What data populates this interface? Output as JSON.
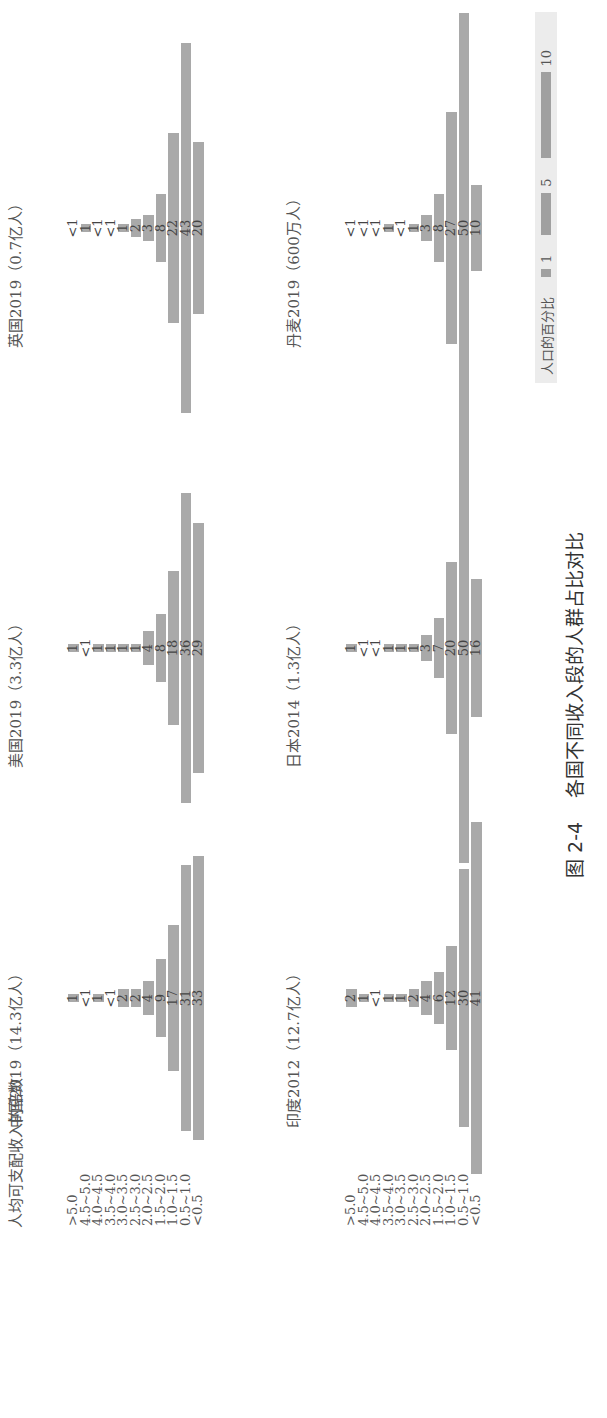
{
  "chart_data": {
    "type": "bar",
    "title": "图 2-4  各国不同收入段的人群占比对比",
    "ylabel": "人均可支配收入的倍数",
    "xlabel": "人口的百分比",
    "categories": [
      ">5.0",
      "4.5~5.0",
      "4.0~4.5",
      "3.5~4.0",
      "3.0~3.5",
      "2.5~3.0",
      "2.0~2.5",
      "1.5~2.0",
      "1.0~1.5",
      "0.5~1.0",
      "<0.5"
    ],
    "series": [
      {
        "name": "中国2019（14.3亿人）",
        "labels": [
          "1",
          "<1",
          "1",
          "<1",
          "2",
          "2",
          "4",
          "9",
          "17",
          "31",
          "33"
        ],
        "values": [
          1,
          0.5,
          1,
          0.5,
          2,
          2,
          4,
          9,
          17,
          31,
          33
        ]
      },
      {
        "name": "美国2019（3.3亿人）",
        "labels": [
          "1",
          "<1",
          "1",
          "1",
          "1",
          "1",
          "4",
          "8",
          "18",
          "36",
          "29"
        ],
        "values": [
          1,
          0.5,
          1,
          1,
          1,
          1,
          4,
          8,
          18,
          36,
          29
        ]
      },
      {
        "name": "英国2019（0.7亿人）",
        "labels": [
          "<1",
          "1",
          "<1",
          "<1",
          "1",
          "2",
          "3",
          "8",
          "22",
          "43",
          "20"
        ],
        "values": [
          0.5,
          1,
          0.5,
          0.5,
          1,
          2,
          3,
          8,
          22,
          43,
          20
        ]
      },
      {
        "name": "印度2012（12.7亿人）",
        "labels": [
          "2",
          "1",
          "<1",
          "1",
          "1",
          "2",
          "4",
          "6",
          "12",
          "30",
          "41"
        ],
        "values": [
          2,
          1,
          0.5,
          1,
          1,
          2,
          4,
          6,
          12,
          30,
          41
        ]
      },
      {
        "name": "日本2014（1.3亿人）",
        "labels": [
          "1",
          "<1",
          "<1",
          "1",
          "1",
          "1",
          "3",
          "7",
          "20",
          "50",
          "16"
        ],
        "values": [
          1,
          0.5,
          0.5,
          1,
          1,
          1,
          3,
          7,
          20,
          50,
          16
        ]
      },
      {
        "name": "丹麦2019（600万人）",
        "labels": [
          "<1",
          "<1",
          "<1",
          "1",
          "<1",
          "1",
          "3",
          "8",
          "27",
          "50",
          "10"
        ],
        "values": [
          0.5,
          0.5,
          0.5,
          1,
          0.5,
          1,
          3,
          8,
          27,
          50,
          10
        ]
      }
    ],
    "legend": {
      "title": "人口的百分比",
      "items": [
        "1",
        "5",
        "10"
      ]
    },
    "orientation": "centered horizontal bars (population pyramid), image rotated 90°"
  },
  "caption": "图 2-4    各国不同收入段的人群占比对比"
}
